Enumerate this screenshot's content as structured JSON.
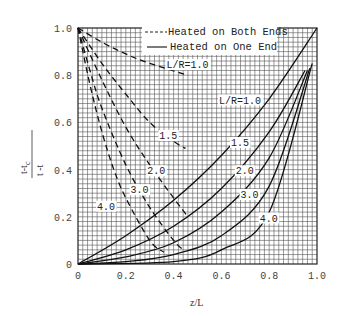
{
  "chart_data": {
    "type": "line",
    "title": "",
    "xlabel": "z/L",
    "ylabel": "(t - t_c) / (t_o - t_c)",
    "ylabel_numerator": "t-t",
    "ylabel_numerator_sub": "c",
    "ylabel_denominator": "t -t",
    "ylabel_denominator_sub1": "o",
    "ylabel_denominator_sub2": "c",
    "xlim": [
      0,
      1.0
    ],
    "ylim": [
      0,
      1.0
    ],
    "grid": true,
    "grid_divisions": 50,
    "x_ticks": [
      "0",
      "0.2",
      "0.4",
      "0.6",
      "0.8",
      "1.0"
    ],
    "y_ticks": [
      "0",
      "0.2",
      "0.4",
      "0.6",
      "0.8",
      "1.0"
    ],
    "legend": {
      "position": "upper-right",
      "entries": [
        {
          "style": "dashed",
          "label": "Heated on Both Ends"
        },
        {
          "style": "solid",
          "label": "Heated on One End"
        }
      ]
    },
    "series": [
      {
        "name": "L/R=1.0",
        "group": "Heated on One End",
        "style": "solid",
        "points": [
          [
            0,
            0
          ],
          [
            0.2,
            0.12
          ],
          [
            0.4,
            0.27
          ],
          [
            0.6,
            0.46
          ],
          [
            0.8,
            0.7
          ],
          [
            1.0,
            1.0
          ]
        ],
        "label": "L/R=1.0",
        "label_at": [
          0.59,
          0.68
        ]
      },
      {
        "name": "L/R=1.5",
        "group": "Heated on One End",
        "style": "solid",
        "points": [
          [
            0,
            0
          ],
          [
            0.2,
            0.06
          ],
          [
            0.4,
            0.16
          ],
          [
            0.6,
            0.32
          ],
          [
            0.8,
            0.56
          ],
          [
            0.95,
            0.82
          ]
        ],
        "label": "1.5",
        "label_at": [
          0.64,
          0.5
        ]
      },
      {
        "name": "L/R=2.0",
        "group": "Heated on One End",
        "style": "solid",
        "points": [
          [
            0,
            0
          ],
          [
            0.2,
            0.03
          ],
          [
            0.4,
            0.09
          ],
          [
            0.6,
            0.22
          ],
          [
            0.8,
            0.45
          ],
          [
            0.96,
            0.82
          ]
        ],
        "label": "2.0",
        "label_at": [
          0.66,
          0.38
        ]
      },
      {
        "name": "L/R=3.0",
        "group": "Heated on One End",
        "style": "solid",
        "points": [
          [
            0,
            0
          ],
          [
            0.2,
            0.01
          ],
          [
            0.4,
            0.04
          ],
          [
            0.6,
            0.12
          ],
          [
            0.8,
            0.33
          ],
          [
            0.97,
            0.83
          ]
        ],
        "label": "3.0",
        "label_at": [
          0.68,
          0.28
        ]
      },
      {
        "name": "L/R=4.0",
        "group": "Heated on One End",
        "style": "solid",
        "points": [
          [
            0,
            0
          ],
          [
            0.4,
            0.01
          ],
          [
            0.6,
            0.06
          ],
          [
            0.8,
            0.22
          ],
          [
            0.98,
            0.85
          ]
        ],
        "label": "4.0",
        "label_at": [
          0.76,
          0.18
        ]
      },
      {
        "name": "L/R=1.0",
        "group": "Heated on Both Ends",
        "style": "dashed",
        "points": [
          [
            0,
            1.0
          ],
          [
            0.1,
            0.94
          ],
          [
            0.2,
            0.89
          ],
          [
            0.3,
            0.85
          ],
          [
            0.46,
            0.8
          ]
        ],
        "label": "L/R=1.0",
        "label_at": [
          0.37,
          0.83
        ]
      },
      {
        "name": "L/R=1.5",
        "group": "Heated on Both Ends",
        "style": "dashed",
        "points": [
          [
            0,
            1.0
          ],
          [
            0.1,
            0.85
          ],
          [
            0.2,
            0.72
          ],
          [
            0.3,
            0.6
          ],
          [
            0.4,
            0.52
          ],
          [
            0.45,
            0.49
          ]
        ],
        "label": "1.5",
        "label_at": [
          0.34,
          0.53
        ]
      },
      {
        "name": "L/R=2.0",
        "group": "Heated on Both Ends",
        "style": "dashed",
        "points": [
          [
            0,
            1.0
          ],
          [
            0.1,
            0.78
          ],
          [
            0.2,
            0.58
          ],
          [
            0.3,
            0.42
          ],
          [
            0.4,
            0.28
          ],
          [
            0.46,
            0.2
          ]
        ],
        "label": "2.0",
        "label_at": [
          0.29,
          0.38
        ]
      },
      {
        "name": "L/R=3.0",
        "group": "Heated on Both Ends",
        "style": "dashed",
        "points": [
          [
            0,
            1.0
          ],
          [
            0.05,
            0.82
          ],
          [
            0.1,
            0.66
          ],
          [
            0.2,
            0.42
          ],
          [
            0.3,
            0.24
          ],
          [
            0.4,
            0.1
          ],
          [
            0.44,
            0.06
          ]
        ],
        "label": "3.0",
        "label_at": [
          0.22,
          0.3
        ]
      },
      {
        "name": "L/R=4.0",
        "group": "Heated on Both Ends",
        "style": "dashed",
        "points": [
          [
            0,
            1.0
          ],
          [
            0.05,
            0.76
          ],
          [
            0.1,
            0.56
          ],
          [
            0.15,
            0.4
          ],
          [
            0.2,
            0.28
          ],
          [
            0.3,
            0.1
          ],
          [
            0.36,
            0.05
          ]
        ],
        "label": "4.0",
        "label_at": [
          0.08,
          0.23
        ]
      }
    ]
  }
}
